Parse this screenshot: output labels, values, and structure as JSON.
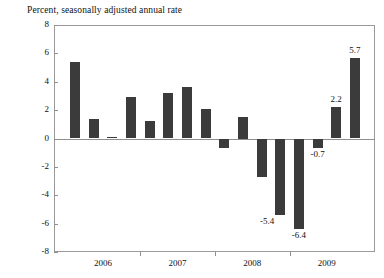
{
  "chart_data": {
    "type": "bar",
    "title": "Percent, seasonally adjusted annual rate",
    "xlabel": "",
    "ylabel": "",
    "ylim": [
      -8,
      8
    ],
    "ytick_values": [
      8,
      6,
      4,
      2,
      0,
      -2,
      -4,
      -6,
      -8
    ],
    "ytick_labels": [
      "8",
      "6",
      "4",
      "2",
      "0",
      "-2",
      "-4",
      "-6",
      "-8"
    ],
    "grid": false,
    "legend": null,
    "bar_color": "#3b3b3b",
    "frame_color": "#9a9a9a",
    "categories": [
      "2006Q1",
      "2006Q2",
      "2006Q3",
      "2006Q4",
      "2007Q1",
      "2007Q2",
      "2007Q3",
      "2007Q4",
      "2008Q1",
      "2008Q2",
      "2008Q3",
      "2008Q4",
      "2009Q1",
      "2009Q2",
      "2009Q3",
      "2009Q4"
    ],
    "values": [
      5.4,
      1.4,
      0.1,
      2.9,
      1.2,
      3.2,
      3.6,
      2.1,
      -0.7,
      1.5,
      -2.7,
      -5.4,
      -6.4,
      -0.7,
      2.2,
      5.7
    ],
    "xtick_labels": [
      "2006",
      "2007",
      "2008",
      "2009"
    ],
    "annotations": [
      {
        "text": "-5.4",
        "value": -5.4,
        "index": 11,
        "placement": "left-below"
      },
      {
        "text": "-6.4",
        "value": -6.4,
        "index": 12,
        "placement": "below"
      },
      {
        "text": "-0.7",
        "value": -0.7,
        "index": 13,
        "placement": "below"
      },
      {
        "text": "2.2",
        "value": 2.2,
        "index": 14,
        "placement": "above"
      },
      {
        "text": "5.7",
        "value": 5.7,
        "index": 15,
        "placement": "above"
      }
    ]
  }
}
